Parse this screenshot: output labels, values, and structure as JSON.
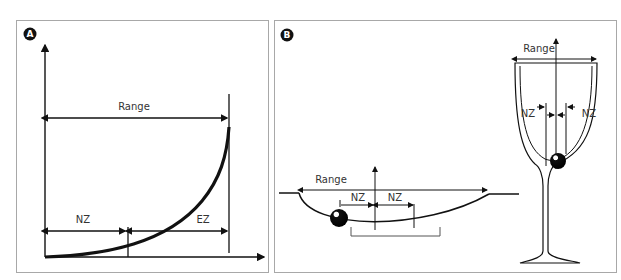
{
  "panel_a": {
    "badge": "A",
    "labels": {
      "range": "Range",
      "nz": "NZ",
      "ez": "EZ"
    }
  },
  "panel_b": {
    "badge": "B",
    "bowl": {
      "range": "Range",
      "nz_left": "NZ",
      "nz_right": "NZ"
    },
    "glass": {
      "range": "Range",
      "nz_left": "NZ",
      "nz_right": "NZ"
    }
  },
  "colors": {
    "line": "#111111",
    "frame": "#a8a8a8",
    "text": "#333333"
  }
}
